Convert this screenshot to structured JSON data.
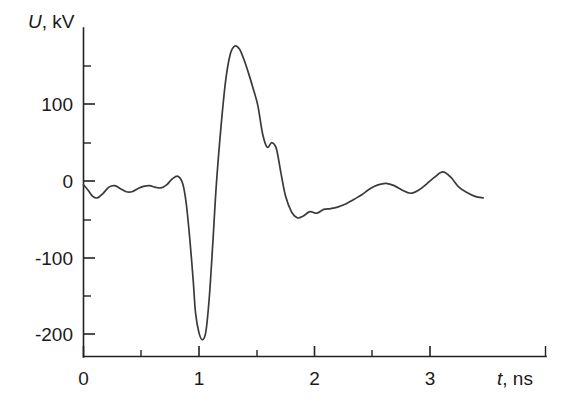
{
  "chart_data": {
    "type": "line",
    "title": "",
    "subtitle": "",
    "xlabel": "t, ns",
    "ylabel": "U, kV",
    "xlabel_symbol": "t",
    "xlabel_unit": ", ns",
    "ylabel_symbol": "U",
    "ylabel_unit": ", kV",
    "xlim": [
      0,
      3.5
    ],
    "ylim": [
      -240,
      200
    ],
    "grid": false,
    "legend": null,
    "legend_position": "none",
    "line_color": "#3a3a3a",
    "axis_color": "#222222",
    "background_color": "#ffffff",
    "x_ticks_major": [
      0,
      1,
      2,
      3
    ],
    "x_tick_labels": [
      "0",
      "1",
      "2",
      "3"
    ],
    "x_ticks_minor": [
      0.5,
      1.5,
      2.5,
      3.5
    ],
    "y_ticks_major": [
      100,
      0,
      -100,
      -200
    ],
    "y_tick_labels": [
      "100",
      "0",
      "-100",
      "-200"
    ],
    "y_ticks_minor": [
      150,
      50,
      -50,
      -150
    ],
    "series": [
      {
        "name": "U(t)",
        "x": [
          0.0,
          0.04,
          0.08,
          0.12,
          0.17,
          0.22,
          0.27,
          0.32,
          0.37,
          0.42,
          0.47,
          0.52,
          0.57,
          0.62,
          0.67,
          0.72,
          0.77,
          0.82,
          0.86,
          0.89,
          0.92,
          0.95,
          0.97,
          1.0,
          1.03,
          1.06,
          1.09,
          1.12,
          1.15,
          1.19,
          1.23,
          1.27,
          1.31,
          1.35,
          1.39,
          1.43,
          1.47,
          1.51,
          1.55,
          1.59,
          1.63,
          1.67,
          1.71,
          1.75,
          1.8,
          1.85,
          1.9,
          1.96,
          2.02,
          2.08,
          2.14,
          2.2,
          2.27,
          2.34,
          2.41,
          2.48,
          2.55,
          2.62,
          2.69,
          2.76,
          2.83,
          2.9,
          2.97,
          3.04,
          3.11,
          3.18,
          3.25,
          3.32,
          3.39,
          3.46
        ],
        "y": [
          -5,
          -12,
          -20,
          -22,
          -16,
          -8,
          -6,
          -10,
          -14,
          -14,
          -10,
          -7,
          -6,
          -8,
          -9,
          -5,
          3,
          6,
          -4,
          -30,
          -75,
          -130,
          -172,
          -198,
          -207,
          -196,
          -150,
          -80,
          -5,
          70,
          130,
          165,
          176,
          172,
          158,
          140,
          120,
          98,
          62,
          44,
          50,
          42,
          10,
          -20,
          -40,
          -48,
          -46,
          -40,
          -42,
          -37,
          -36,
          -34,
          -30,
          -24,
          -18,
          -10,
          -5,
          -3,
          -6,
          -12,
          -16,
          -12,
          -4,
          5,
          12,
          5,
          -8,
          -15,
          -20,
          -22
        ]
      }
    ],
    "annotations": [],
    "markers": {
      "negative_peak": {
        "x": 0.97,
        "y": -207
      },
      "positive_peak": {
        "x": 1.31,
        "y": 176
      },
      "shoulder": {
        "x": 1.63,
        "y": 50
      }
    }
  }
}
